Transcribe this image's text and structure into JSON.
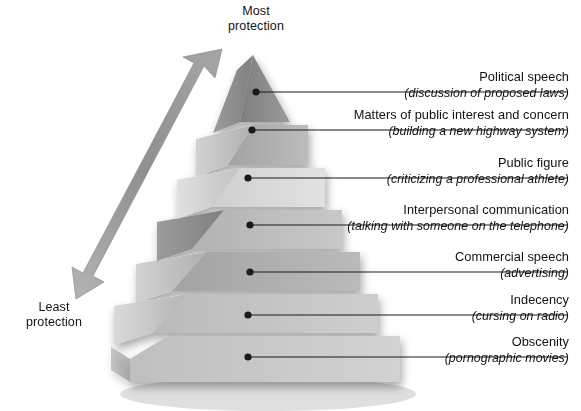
{
  "figure": {
    "top_axis_label": "Most\nprotection",
    "bottom_axis_label": "Least\nprotection",
    "arrow_icon": "double-headed-arrow-icon",
    "colors": {
      "tier_top_front": "#8d8d8d",
      "tier_top_side": "#a8a8a8",
      "tier_2_front": "#b0b0b0",
      "tier_3_front": "#d8d8d8",
      "tier_4_front": "#bdbdbd",
      "tier_5_front": "#aeaeae",
      "tier_6_front": "#c4c4c4",
      "tier_7_front": "#c9c9c9",
      "arrow": "#9a9a9a",
      "leader_line": "#1a1a1a",
      "text": "#111111"
    }
  },
  "tiers": [
    {
      "rank": 1,
      "title": "Political speech",
      "example": "(discussion of proposed laws)"
    },
    {
      "rank": 2,
      "title": "Matters of public interest and concern",
      "example": "(building a new highway system)"
    },
    {
      "rank": 3,
      "title": "Public figure",
      "example": "(criticizing a professional athlete)"
    },
    {
      "rank": 4,
      "title": "Interpersonal communication",
      "example": "(talking with someone on the telephone)"
    },
    {
      "rank": 5,
      "title": "Commercial speech",
      "example": "(advertising)"
    },
    {
      "rank": 6,
      "title": "Indecency",
      "example": "(cursing on radio)"
    },
    {
      "rank": 7,
      "title": "Obscenity",
      "example": "(pornographic movies)"
    }
  ]
}
